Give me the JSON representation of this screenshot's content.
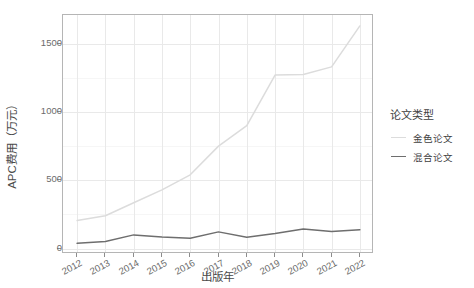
{
  "chart_data": {
    "type": "line",
    "title": "",
    "xlabel": "出版年",
    "ylabel": "APC费用（万元）",
    "x": [
      2012,
      2013,
      2014,
      2015,
      2016,
      2017,
      2018,
      2019,
      2020,
      2021,
      2022
    ],
    "categories": [
      "2012",
      "2013",
      "2014",
      "2015",
      "2016",
      "2017",
      "2018",
      "2019",
      "2020",
      "2021",
      "2022"
    ],
    "series": [
      {
        "name": "金色论文",
        "color": "#dcdcdc",
        "values": [
          205,
          240,
          335,
          430,
          540,
          750,
          900,
          1270,
          1275,
          1330,
          1630
        ]
      },
      {
        "name": "混合论文",
        "color": "#6e6e6e",
        "values": [
          38,
          52,
          100,
          85,
          75,
          122,
          82,
          110,
          143,
          125,
          137
        ]
      }
    ],
    "xlim": [
      2011.5,
      2022.5
    ],
    "ylim": [
      -40,
      1710
    ],
    "yticks": [
      0,
      500,
      1000,
      1500
    ],
    "ytick_labels": [
      "0",
      "500",
      "1000",
      "1500"
    ],
    "grid": true,
    "legend_position": "right",
    "legend_title": "论文类型"
  },
  "legend": {
    "title": "论文类型",
    "entries": [
      {
        "label": "金色论文",
        "color": "#dcdcdc",
        "key": "line-key-gold"
      },
      {
        "label": "混合论文",
        "color": "#6e6e6e",
        "key": "line-key-hybrid"
      }
    ]
  },
  "axes": {
    "y_title": "APC费用（万元）",
    "x_title": "出版年",
    "y_tick_labels": [
      "1500",
      "1000",
      "500",
      "0"
    ],
    "x_tick_labels": [
      "2012",
      "2013",
      "2014",
      "2015",
      "2016",
      "2017",
      "2018",
      "2019",
      "2020",
      "2021",
      "2022"
    ]
  },
  "colors": {
    "panel_border": "#b5b5b5",
    "grid_major": "#e9e9e9",
    "grid_minor": "#f6f6f6",
    "text": "#4d4d4d",
    "background": "#ffffff"
  }
}
